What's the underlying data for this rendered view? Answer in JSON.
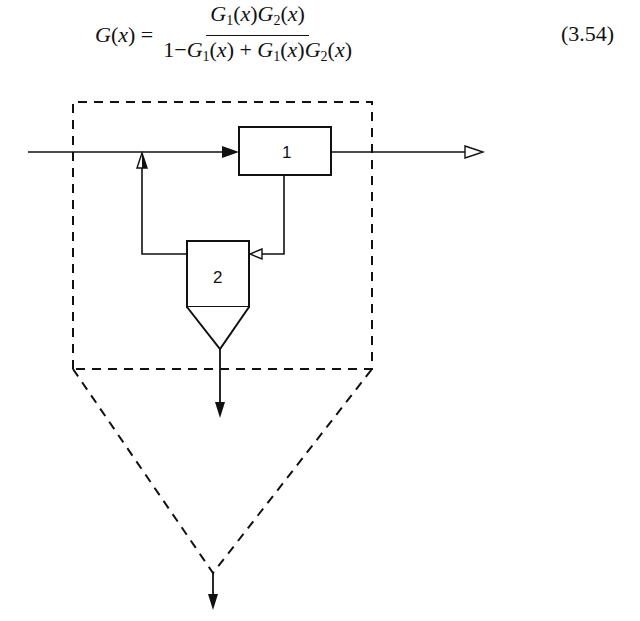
{
  "equation": {
    "lhs": "G(x) =",
    "numerator": "G1(x)G2(x)",
    "denominator": "1 − G1(x) + G1(x)G2(x)",
    "number": "(3.54)"
  },
  "diagram": {
    "blocks": [
      {
        "id": "1",
        "label": "1",
        "role": "first stage"
      },
      {
        "id": "2",
        "label": "2",
        "role": "second stage with hopper/cyclone outlet"
      }
    ],
    "flows": [
      {
        "from": "input",
        "to": "1",
        "arrow": "filled"
      },
      {
        "from": "1",
        "to": "output",
        "arrow": "open"
      },
      {
        "from": "1",
        "to": "2",
        "arrow": "open"
      },
      {
        "from": "2",
        "to": "input-junction",
        "arrow": "open/filled"
      },
      {
        "from": "2",
        "to": "underflow",
        "arrow": "filled"
      },
      {
        "from": "system",
        "to": "combined-underflow",
        "arrow": "filled"
      }
    ],
    "system_boundary": "dashed"
  }
}
